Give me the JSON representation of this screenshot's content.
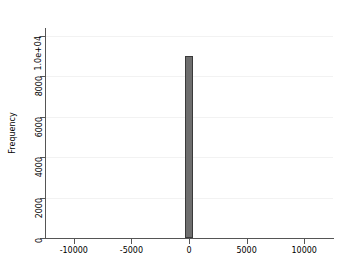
{
  "chart_data": {
    "type": "bar",
    "title": "",
    "subtitle": "",
    "xlabel": "",
    "ylabel": "Frequency",
    "x": [
      0
    ],
    "values": [
      9000
    ],
    "categories": [
      "0"
    ],
    "series": [
      {
        "name": "Frequency",
        "values": [
          9000
        ]
      }
    ],
    "xlim": [
      -12500,
      12500
    ],
    "ylim": [
      0,
      10400
    ],
    "xticks": [
      -10000,
      -5000,
      0,
      5000,
      10000
    ],
    "xticklabels": [
      "-10000",
      "-5000",
      "0",
      "5000",
      "10000"
    ],
    "yticks": [
      0,
      2000,
      4000,
      6000,
      8000,
      10000
    ],
    "yticklabels": [
      "0",
      "2000",
      "4000",
      "6000",
      "8000",
      "1.0e+04"
    ],
    "grid": "horizontal",
    "legend": "none",
    "annotations": [],
    "bar_color": "#6e6e6e",
    "bar_edge_color": "#3a3a3a",
    "grid_color": "#f2f2f2",
    "axis_color": "#555555",
    "background_color": "#ffffff",
    "bar_width_data": 700
  }
}
